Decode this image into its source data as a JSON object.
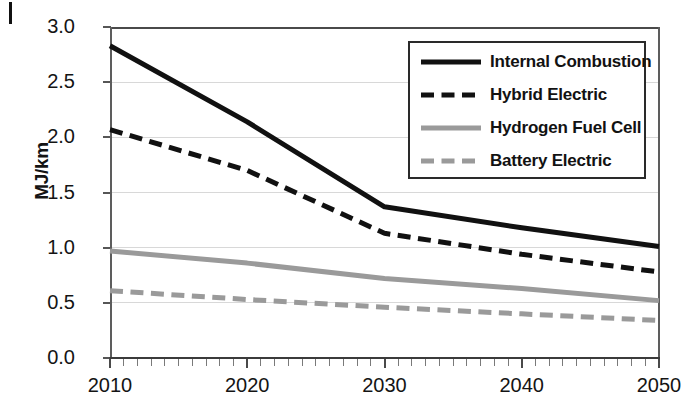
{
  "chart_data": {
    "type": "line",
    "title": "",
    "xlabel": "",
    "ylabel": "MJ/km",
    "xlim": [
      2010,
      2050
    ],
    "ylim": [
      0.0,
      3.0
    ],
    "grid": true,
    "legend_position": "top-right",
    "x": [
      2010,
      2020,
      2030,
      2040,
      2050
    ],
    "xticklabels": [
      "2010",
      "2020",
      "2030",
      "2040",
      "2050"
    ],
    "yticklabels": [
      "0.0",
      "0.5",
      "1.0",
      "1.5",
      "2.0",
      "2.5",
      "3.0"
    ],
    "ytickvalues": [
      0.0,
      0.5,
      1.0,
      1.5,
      2.0,
      2.5,
      3.0
    ],
    "xtick_minor_step": 1,
    "series": [
      {
        "name": "Internal Combustion",
        "style": "solid",
        "color": "#111111",
        "width": 5,
        "values": [
          2.83,
          2.14,
          1.37,
          1.18,
          1.01
        ]
      },
      {
        "name": "Hybrid Electric",
        "style": "dashed",
        "color": "#111111",
        "width": 5,
        "values": [
          2.07,
          1.7,
          1.13,
          0.94,
          0.78
        ]
      },
      {
        "name": "Hydrogen Fuel Cell",
        "style": "solid",
        "color": "#9a9a9a",
        "width": 5,
        "values": [
          0.97,
          0.86,
          0.72,
          0.63,
          0.52
        ]
      },
      {
        "name": "Battery Electric",
        "style": "dashed",
        "color": "#9a9a9a",
        "width": 5,
        "values": [
          0.61,
          0.53,
          0.46,
          0.4,
          0.34
        ]
      }
    ]
  },
  "legend": {
    "items": [
      {
        "label": "Internal Combustion"
      },
      {
        "label": "Hybrid Electric"
      },
      {
        "label": "Hydrogen Fuel Cell"
      },
      {
        "label": "Battery Electric"
      }
    ]
  },
  "axes": {
    "y_title": "MJ/km",
    "y_labels": [
      "3.0",
      "2.5",
      "2.0",
      "1.5",
      "1.0",
      "0.5",
      "0.0"
    ],
    "x_labels": [
      "2010",
      "2020",
      "2030",
      "2040",
      "2050"
    ]
  },
  "colors": {
    "series_dark": "#111111",
    "series_gray": "#9a9a9a",
    "grid": "#d8d8d8",
    "axis": "#4a4a4a",
    "text": "#141414"
  }
}
